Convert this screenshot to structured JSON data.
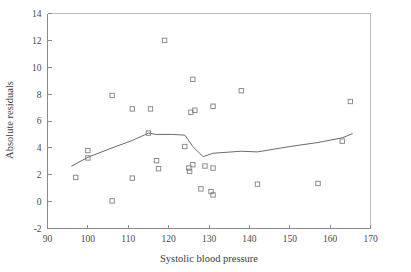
{
  "chart_data": {
    "type": "scatter",
    "title": "",
    "xlabel": "Systolic blood pressure",
    "ylabel": "Absolute residuals",
    "xlim": [
      90,
      170
    ],
    "ylim": [
      -2,
      14
    ],
    "xticks": [
      90,
      100,
      110,
      120,
      130,
      140,
      150,
      160,
      170
    ],
    "xtick_labels": [
      "90",
      "100",
      "110",
      "120",
      "130",
      "140",
      "150",
      "160",
      "170"
    ],
    "yticks": [
      -2,
      0,
      2,
      4,
      6,
      8,
      10,
      12,
      14
    ],
    "ytick_labels": [
      "-2",
      "0",
      "2",
      "4",
      "6",
      "8",
      "10",
      "12",
      "14"
    ],
    "grid": false,
    "legend": null,
    "marker": "open-square",
    "marker_color": "#808080",
    "line_color": "#6b6b6b",
    "points": [
      {
        "x": 97.0,
        "y": 1.8
      },
      {
        "x": 100.0,
        "y": 3.8
      },
      {
        "x": 100.0,
        "y": 3.25
      },
      {
        "x": 106.0,
        "y": 7.9
      },
      {
        "x": 106.0,
        "y": 0.05
      },
      {
        "x": 111.0,
        "y": 6.9
      },
      {
        "x": 111.0,
        "y": 1.75
      },
      {
        "x": 115.0,
        "y": 5.1
      },
      {
        "x": 115.5,
        "y": 6.9
      },
      {
        "x": 117.0,
        "y": 3.05
      },
      {
        "x": 117.5,
        "y": 2.45
      },
      {
        "x": 119.0,
        "y": 12.0
      },
      {
        "x": 124.0,
        "y": 4.1
      },
      {
        "x": 125.5,
        "y": 6.65
      },
      {
        "x": 126.0,
        "y": 9.1
      },
      {
        "x": 126.5,
        "y": 6.8
      },
      {
        "x": 125.0,
        "y": 2.5
      },
      {
        "x": 125.2,
        "y": 2.25
      },
      {
        "x": 126.0,
        "y": 2.75
      },
      {
        "x": 128.0,
        "y": 0.95
      },
      {
        "x": 129.0,
        "y": 2.65
      },
      {
        "x": 130.5,
        "y": 0.75
      },
      {
        "x": 131.0,
        "y": 0.5
      },
      {
        "x": 131.0,
        "y": 2.5
      },
      {
        "x": 131.0,
        "y": 7.1
      },
      {
        "x": 138.0,
        "y": 8.25
      },
      {
        "x": 142.0,
        "y": 1.3
      },
      {
        "x": 157.0,
        "y": 1.35
      },
      {
        "x": 163.0,
        "y": 4.5
      },
      {
        "x": 165.0,
        "y": 7.45
      }
    ],
    "smooth_line": [
      {
        "x": 96.0,
        "y": 2.65
      },
      {
        "x": 100.0,
        "y": 3.3
      },
      {
        "x": 106.0,
        "y": 4.0
      },
      {
        "x": 111.0,
        "y": 4.55
      },
      {
        "x": 115.0,
        "y": 5.1
      },
      {
        "x": 117.0,
        "y": 5.0
      },
      {
        "x": 121.0,
        "y": 5.0
      },
      {
        "x": 124.0,
        "y": 4.95
      },
      {
        "x": 126.0,
        "y": 4.1
      },
      {
        "x": 128.5,
        "y": 3.35
      },
      {
        "x": 131.0,
        "y": 3.6
      },
      {
        "x": 138.0,
        "y": 3.75
      },
      {
        "x": 142.0,
        "y": 3.7
      },
      {
        "x": 150.0,
        "y": 4.1
      },
      {
        "x": 157.0,
        "y": 4.4
      },
      {
        "x": 163.0,
        "y": 4.75
      },
      {
        "x": 165.5,
        "y": 5.05
      }
    ]
  }
}
